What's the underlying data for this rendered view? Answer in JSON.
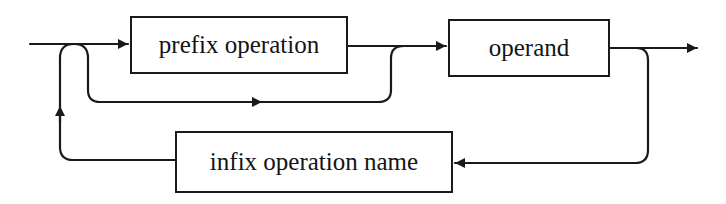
{
  "diagram": {
    "type": "syntax-railroad-diagram",
    "nodes": {
      "prefix": {
        "label": "prefix operation"
      },
      "operand": {
        "label": "operand"
      },
      "infix": {
        "label": "infix operation name"
      }
    },
    "edges": [
      {
        "from": "entry",
        "to": "prefix",
        "label": ""
      },
      {
        "from": "entry",
        "to": "operand",
        "label": "bypass prefix (optional)"
      },
      {
        "from": "prefix",
        "to": "operand",
        "label": ""
      },
      {
        "from": "operand",
        "to": "exit",
        "label": ""
      },
      {
        "from": "operand",
        "to": "infix",
        "label": "loop back"
      },
      {
        "from": "infix",
        "to": "entry",
        "label": "repeat"
      }
    ],
    "colors": {
      "stroke": "#1a1a1a",
      "background": "#ffffff",
      "text": "#141414"
    }
  }
}
